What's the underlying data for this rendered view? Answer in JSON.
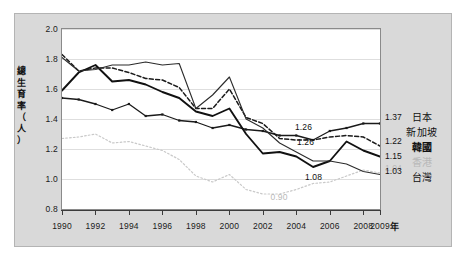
{
  "chart_data": {
    "type": "line",
    "title": "",
    "xlabel": "年",
    "ylabel": "總生育率（人）",
    "xlim": [
      1990,
      2009
    ],
    "ylim": [
      0.8,
      2.0
    ],
    "ytick_labels": [
      "2.0",
      "1.8",
      "1.6",
      "1.4",
      "1.2",
      "1.0",
      "0.8"
    ],
    "ytick_values": [
      2.0,
      1.8,
      1.6,
      1.4,
      1.2,
      1.0,
      0.8
    ],
    "xtick_labels": [
      "1990",
      "1992",
      "1994",
      "1996",
      "1998",
      "2000",
      "2002",
      "2004",
      "2006",
      "2008",
      "2009"
    ],
    "xtick_values": [
      1990,
      1992,
      1994,
      1996,
      1998,
      2000,
      2002,
      2004,
      2006,
      2008,
      2009
    ],
    "grid": "horizontal",
    "legend_position": "right",
    "x": [
      1990,
      1991,
      1992,
      1993,
      1994,
      1995,
      1996,
      1997,
      1998,
      1999,
      2000,
      2001,
      2002,
      2003,
      2004,
      2005,
      2006,
      2007,
      2008,
      2009
    ],
    "series": [
      {
        "name": "日本",
        "label": "日本",
        "style": "solid-markers",
        "color": "#1a1a1a",
        "end_value": "1.37",
        "values": [
          1.54,
          1.53,
          1.5,
          1.46,
          1.5,
          1.42,
          1.43,
          1.39,
          1.38,
          1.34,
          1.36,
          1.33,
          1.32,
          1.29,
          1.29,
          1.26,
          1.32,
          1.34,
          1.37,
          1.37
        ]
      },
      {
        "name": "新加坡",
        "label": "新加坡",
        "style": "dashed",
        "color": "#1a1a1a",
        "end_value": "1.22",
        "values": [
          1.83,
          1.72,
          1.74,
          1.74,
          1.71,
          1.67,
          1.66,
          1.61,
          1.47,
          1.47,
          1.6,
          1.41,
          1.37,
          1.27,
          1.26,
          1.26,
          1.28,
          1.29,
          1.28,
          1.22
        ]
      },
      {
        "name": "韓國",
        "label": "韓國",
        "style": "solid-bold",
        "color": "#111111",
        "end_value": "1.15",
        "values": [
          1.59,
          1.71,
          1.76,
          1.65,
          1.66,
          1.63,
          1.58,
          1.54,
          1.45,
          1.42,
          1.47,
          1.3,
          1.17,
          1.18,
          1.15,
          1.08,
          1.12,
          1.25,
          1.19,
          1.15
        ]
      },
      {
        "name": "香港",
        "label": "香港",
        "style": "dotted-faint",
        "color": "#c9c9c9",
        "end_value": "1.04",
        "values": [
          1.27,
          1.28,
          1.3,
          1.24,
          1.25,
          1.22,
          1.19,
          1.13,
          1.02,
          0.98,
          1.03,
          0.93,
          0.9,
          0.9,
          0.93,
          0.97,
          0.98,
          1.02,
          1.06,
          1.04
        ]
      },
      {
        "name": "台灣",
        "label": "台灣",
        "style": "solid-thin",
        "color": "#2b2b2b",
        "end_value": "1.03",
        "values": [
          1.81,
          1.72,
          1.73,
          1.76,
          1.76,
          1.78,
          1.76,
          1.77,
          1.47,
          1.56,
          1.68,
          1.4,
          1.34,
          1.24,
          1.18,
          1.12,
          1.12,
          1.1,
          1.05,
          1.03
        ]
      }
    ],
    "annotations": [
      {
        "text": "1.26",
        "series": "日本",
        "year": 2005,
        "value": 1.26,
        "style": "normal"
      },
      {
        "text": "1.26",
        "series": "新加坡",
        "year": 2005,
        "value": 1.26,
        "style": "normal"
      },
      {
        "text": "1.08",
        "series": "韓國",
        "year": 2005,
        "value": 1.08,
        "style": "normal"
      },
      {
        "text": "0.90",
        "series": "香港",
        "year": 2003,
        "value": 0.9,
        "style": "faint"
      },
      {
        "text": "1.37",
        "series": "日本",
        "year": 2009,
        "value": 1.37,
        "style": "normal"
      },
      {
        "text": "1.22",
        "series": "新加坡",
        "year": 2009,
        "value": 1.22,
        "style": "normal"
      },
      {
        "text": "1.15",
        "series": "韓國",
        "year": 2009,
        "value": 1.15,
        "style": "normal"
      },
      {
        "text": "1.04",
        "series": "香港",
        "year": 2009,
        "value": 1.04,
        "style": "faint"
      },
      {
        "text": "1.03",
        "series": "台灣",
        "year": 2009,
        "value": 1.03,
        "style": "normal"
      }
    ]
  },
  "axis": {
    "y_title_chars": [
      "總",
      "生",
      "育",
      "率",
      "（",
      "人",
      "）"
    ],
    "x_title": "年"
  },
  "legend": {
    "items": [
      {
        "label": "日本",
        "style": "normal"
      },
      {
        "label": "新加坡",
        "style": "normal"
      },
      {
        "label": "韓國",
        "style": "bold"
      },
      {
        "label": "香港",
        "style": "faint"
      },
      {
        "label": "台灣",
        "style": "normal"
      }
    ]
  },
  "colors": {
    "panel_bg": "#d9d9d9",
    "plot_bg": "#ffffff",
    "grid": "#dedede",
    "axis": "#3c3c3c",
    "faint_series": "#c9c9c9",
    "dark_series": "#1a1a1a"
  }
}
